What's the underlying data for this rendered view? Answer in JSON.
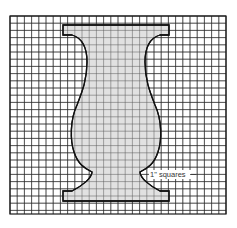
{
  "figure": {
    "type": "pattern-on-grid",
    "grid": {
      "x": 10,
      "y": 16,
      "width": 216,
      "height": 198,
      "cell": 7.2,
      "line_color": "#2a2a2a",
      "border_color": "#1a1a1a"
    },
    "shape": {
      "fill": "#dcdcdc",
      "stroke": "#111111"
    },
    "label": {
      "text": "1\" squares",
      "x": 150,
      "y": 177,
      "leader_to_x": 196
    }
  }
}
